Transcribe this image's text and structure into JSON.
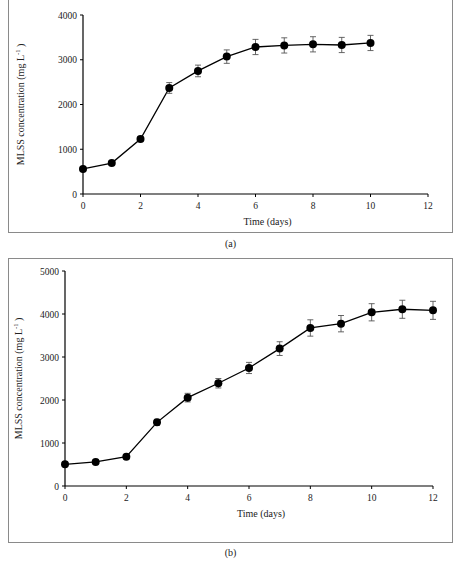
{
  "figure": {
    "captions": [
      "(a)",
      "(b)"
    ]
  },
  "chart_data": [
    {
      "type": "line",
      "panel": "(a)",
      "title": "",
      "xlabel": "Time (days)",
      "ylabel": "MLSS concentration (mg L⁻¹)",
      "ylabel_main": "MLSS concentration (mg L",
      "ylabel_sup": "-1",
      "ylabel_close": ")",
      "xlim": [
        0,
        12
      ],
      "ylim": [
        0,
        4000
      ],
      "xticks": [
        0,
        2,
        4,
        6,
        8,
        10,
        12
      ],
      "yticks": [
        0,
        1000,
        2000,
        3000,
        4000
      ],
      "grid": false,
      "legend": null,
      "marker": "filled-circle",
      "color": "#000000",
      "series": [
        {
          "name": "MLSS",
          "x": [
            0,
            1,
            2,
            3,
            4,
            5,
            6,
            7,
            8,
            9,
            10
          ],
          "values": [
            560,
            690,
            1230,
            2370,
            2750,
            3070,
            3285,
            3320,
            3345,
            3330,
            3375
          ],
          "error": [
            40,
            40,
            50,
            120,
            130,
            150,
            170,
            170,
            170,
            170,
            170
          ]
        }
      ]
    },
    {
      "type": "line",
      "panel": "(b)",
      "title": "",
      "xlabel": "Time (days)",
      "ylabel": "MLSS concentration (mg L⁻¹)",
      "ylabel_main": "MLSS concentration (mg L",
      "ylabel_sup": "-1",
      "ylabel_close": ")",
      "xlim": [
        0,
        12
      ],
      "ylim": [
        0,
        5000
      ],
      "xticks": [
        0,
        2,
        4,
        6,
        8,
        10,
        12
      ],
      "yticks": [
        0,
        1000,
        2000,
        3000,
        4000,
        5000
      ],
      "grid": false,
      "legend": null,
      "marker": "filled-circle",
      "color": "#000000",
      "series": [
        {
          "name": "MLSS",
          "x": [
            0,
            1,
            2,
            3,
            4,
            5,
            6,
            7,
            8,
            9,
            10,
            11,
            12
          ],
          "values": [
            505,
            560,
            680,
            1480,
            2055,
            2390,
            2745,
            3195,
            3675,
            3775,
            4040,
            4110,
            4085
          ],
          "error": [
            40,
            40,
            50,
            70,
            100,
            110,
            130,
            160,
            190,
            190,
            200,
            210,
            210
          ]
        }
      ]
    }
  ]
}
